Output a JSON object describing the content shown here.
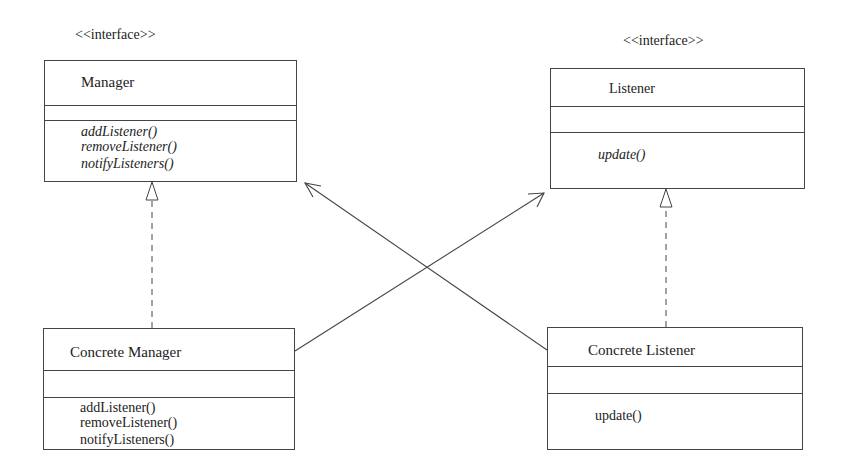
{
  "diagram": {
    "type": "UML class diagram",
    "line_color": "#444444",
    "classes": [
      {
        "id": "manager",
        "stereotype": "<<interface>>",
        "name": "Manager",
        "attributes": [],
        "operations": [
          "addListener()",
          "removeListener()",
          "notifyListeners()"
        ],
        "operations_italic": true
      },
      {
        "id": "listener",
        "stereotype": "<<interface>>",
        "name": "Listener",
        "attributes": [],
        "operations": [
          "update()"
        ],
        "operations_italic": true
      },
      {
        "id": "concrete_manager",
        "stereotype": "",
        "name": "Concrete Manager",
        "attributes": [],
        "operations": [
          "addListener()",
          "removeListener()",
          "notifyListeners()"
        ],
        "operations_italic": false
      },
      {
        "id": "concrete_listener",
        "stereotype": "",
        "name": "Concrete Listener",
        "attributes": [],
        "operations": [
          "update()"
        ],
        "operations_italic": false
      }
    ],
    "relationships": [
      {
        "from": "concrete_manager",
        "to": "manager",
        "kind": "realization",
        "style": "dashed line, hollow triangle"
      },
      {
        "from": "concrete_listener",
        "to": "listener",
        "kind": "realization",
        "style": "dashed line, hollow triangle"
      },
      {
        "from": "concrete_manager",
        "to": "listener",
        "kind": "association",
        "style": "solid line, open arrowhead"
      },
      {
        "from": "concrete_listener",
        "to": "manager",
        "kind": "association",
        "style": "solid line, open arrowhead"
      }
    ]
  }
}
